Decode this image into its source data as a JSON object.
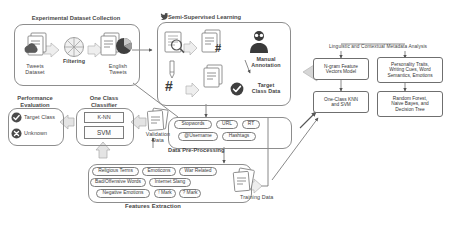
{
  "diagram": {
    "type": "methodology-flowchart"
  },
  "sections": {
    "dataset_collection": {
      "title": "Experimental Dataset Collection",
      "nodes": [
        {
          "name": "tweets-dataset",
          "label": "Tweets\nDataset",
          "icon": "document-cloud-icon"
        },
        {
          "name": "filtering",
          "label": "Filtering",
          "icon": "funnel-wheel-icon"
        },
        {
          "name": "english-tweets",
          "label": "English\nTweets",
          "icon": "document-piechart-icon"
        }
      ]
    },
    "semi_supervised": {
      "title": "Semi-Supervised Learning",
      "icon": "twitter-bird-icon",
      "nodes": [
        {
          "name": "search-documents",
          "label": "",
          "icon": "document-magnifier-icon"
        },
        {
          "name": "hashtag-documents",
          "label": "",
          "icon": "document-hashtag-icon"
        },
        {
          "name": "pen-hashtag",
          "label": "",
          "icon": "pen-hashtag-icon"
        },
        {
          "name": "annotation-person",
          "label": "Manual\nAnnotation",
          "icon": "person-icon"
        },
        {
          "name": "target-class-data",
          "label": "Target\nClass Data",
          "icon": "check-circle-icon"
        }
      ]
    },
    "metadata_analysis": {
      "title": "Linguistic and Contextual Metadata Analysis",
      "boxes": [
        {
          "name": "ngram-feature-box",
          "label": "N-gram Feature\nVectors Model"
        },
        {
          "name": "personality-traits-box",
          "label": "Personality Traits,\nWriting Cues, Word\nSemantics, Emotions"
        },
        {
          "name": "one-class-knn-svm-box",
          "label": "One-Class KNN\nand SVM"
        },
        {
          "name": "random-forest-box",
          "label": "Random Forest,\nNaive Bayes, and\nDecision Tree"
        }
      ]
    },
    "preprocessing": {
      "title": "Data Pre-Processing",
      "tags": [
        {
          "name": "tag-stopwords",
          "label": "Stopwords"
        },
        {
          "name": "tag-url",
          "label": "URL"
        },
        {
          "name": "tag-rt",
          "label": "RT"
        },
        {
          "name": "tag-username",
          "label": "@Username"
        },
        {
          "name": "tag-hashtags",
          "label": "Hashtags"
        }
      ]
    },
    "features_extraction": {
      "title": "Features Extraction",
      "tags": [
        {
          "name": "tag-religious-terms",
          "label": "Religious Terms"
        },
        {
          "name": "tag-emoticons",
          "label": "Emoticons"
        },
        {
          "name": "tag-war-related",
          "label": "War Related"
        },
        {
          "name": "tag-bad-offensive-words",
          "label": "Bad/Offensive Words"
        },
        {
          "name": "tag-internet-slang",
          "label": "Internet Slang"
        },
        {
          "name": "tag-negative-emotions",
          "label": "Negative Emotions"
        },
        {
          "name": "tag-exclamation-mark",
          "label": "! Mark"
        },
        {
          "name": "tag-question-mark",
          "label": "? Mark"
        }
      ]
    },
    "one_class_classifier": {
      "title": "One Class\nClassifier",
      "models": [
        {
          "name": "model-knn",
          "label": "K-NN"
        },
        {
          "name": "model-svm",
          "label": "SVM"
        }
      ]
    },
    "performance_evaluation": {
      "title": "Performance\nEvaluation",
      "outcomes": [
        {
          "name": "outcome-target-class",
          "label": "Target Class",
          "icon": "check-circle-icon"
        },
        {
          "name": "outcome-unknown",
          "label": "Unknown",
          "icon": "cross-circle-icon"
        }
      ]
    },
    "data_nodes": {
      "validation_data": "Validation\nData",
      "training_data": "Training Data"
    }
  },
  "colors": {
    "stroke": "#7c7c7c",
    "group_stroke": "#8d8d8d",
    "text": "#3c3c3c",
    "arrow_fill": "#d9d9d9",
    "dark_fill": "#4b4b4b"
  }
}
